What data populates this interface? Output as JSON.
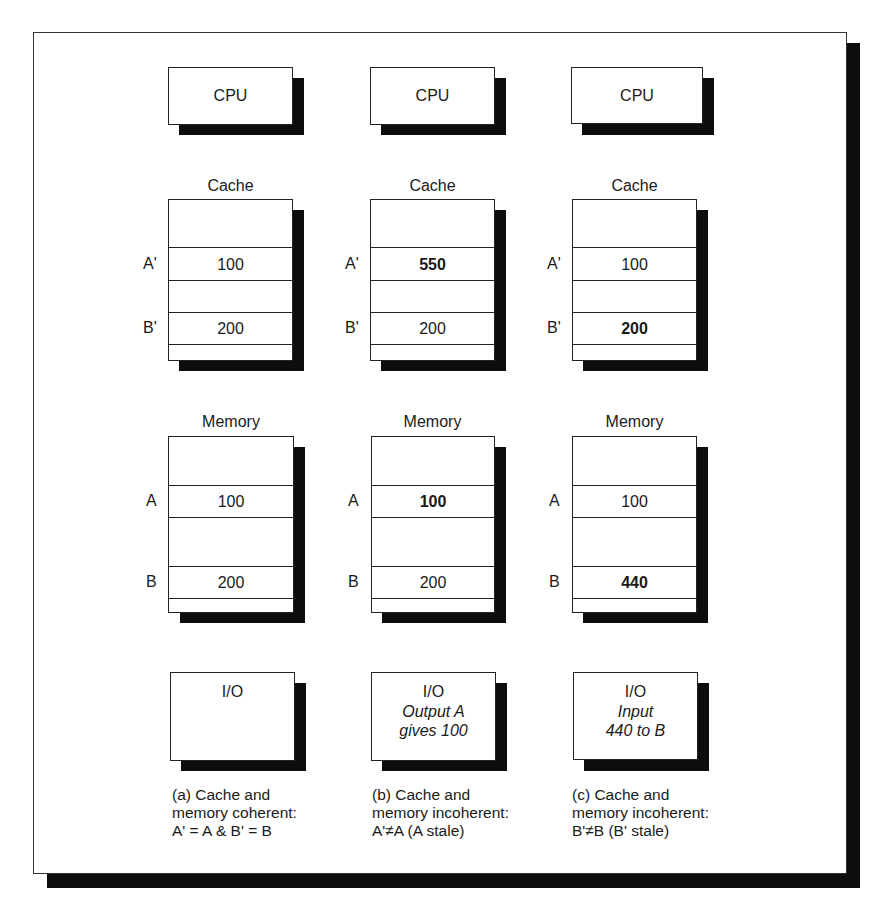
{
  "figure": {
    "columns": [
      {
        "id": "a",
        "cpu": {
          "label": "CPU"
        },
        "cache": {
          "title": "Cache",
          "rows": [
            {
              "label": "A'",
              "value": "100",
              "bold": false
            },
            {
              "label": "B'",
              "value": "200",
              "bold": false
            }
          ]
        },
        "memory": {
          "title": "Memory",
          "rows": [
            {
              "label": "A",
              "value": "100",
              "bold": false
            },
            {
              "label": "B",
              "value": "200",
              "bold": false
            }
          ]
        },
        "io": {
          "label": "I/O",
          "note_line1": "",
          "note_line2": ""
        },
        "caption": [
          "(a) Cache and",
          "memory coherent:",
          "A' = A & B' = B"
        ]
      },
      {
        "id": "b",
        "cpu": {
          "label": "CPU"
        },
        "cache": {
          "title": "Cache",
          "rows": [
            {
              "label": "A'",
              "value": "550",
              "bold": true
            },
            {
              "label": "B'",
              "value": "200",
              "bold": false
            }
          ]
        },
        "memory": {
          "title": "Memory",
          "rows": [
            {
              "label": "A",
              "value": "100",
              "bold": true
            },
            {
              "label": "B",
              "value": "200",
              "bold": false
            }
          ]
        },
        "io": {
          "label": "I/O",
          "note_line1": "Output A",
          "note_line2": "gives 100"
        },
        "caption": [
          "(b) Cache and",
          "memory incoherent:",
          "A'≠A (A stale)"
        ]
      },
      {
        "id": "c",
        "cpu": {
          "label": "CPU"
        },
        "cache": {
          "title": "Cache",
          "rows": [
            {
              "label": "A'",
              "value": "100",
              "bold": false
            },
            {
              "label": "B'",
              "value": "200",
              "bold": true
            }
          ]
        },
        "memory": {
          "title": "Memory",
          "rows": [
            {
              "label": "A",
              "value": "100",
              "bold": false
            },
            {
              "label": "B",
              "value": "440",
              "bold": true
            }
          ]
        },
        "io": {
          "label": "I/O",
          "note_line1": "Input",
          "note_line2": "440 to B"
        },
        "caption": [
          "(c) Cache and",
          "memory incoherent:",
          "B'≠B (B' stale)"
        ]
      }
    ]
  }
}
